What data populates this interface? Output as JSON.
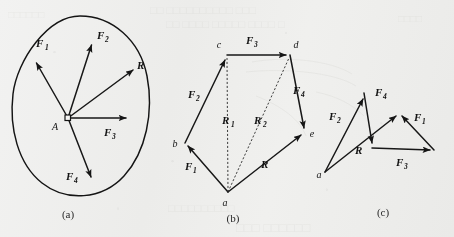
{
  "figure": {
    "background_color": "#f7f7f6",
    "ink_color": "#151515",
    "panel_count": 3
  },
  "panels": [
    {
      "id": "a",
      "caption": "(a)",
      "description": "Concurrent forces acting at point A inside a closed body outline",
      "origin_label": "A",
      "vectors": [
        {
          "name": "F1",
          "label": "F",
          "subscript": "1",
          "from": [
            68,
            118
          ],
          "to": [
            34,
            59
          ],
          "label_pos": [
            36,
            47
          ]
        },
        {
          "name": "F2",
          "label": "F",
          "subscript": "2",
          "from": [
            68,
            118
          ],
          "to": [
            93,
            41
          ],
          "label_pos": [
            98,
            39
          ]
        },
        {
          "name": "R",
          "label": "R",
          "subscript": "",
          "from": [
            68,
            118
          ],
          "to": [
            136,
            67
          ],
          "label_pos": [
            139,
            67
          ]
        },
        {
          "name": "F3",
          "label": "F",
          "subscript": "3",
          "from": [
            68,
            118
          ],
          "to": [
            130,
            118
          ],
          "label_pos": [
            108,
            134
          ]
        },
        {
          "name": "F4",
          "label": "F",
          "subscript": "4",
          "from": [
            68,
            118
          ],
          "to": [
            93,
            182
          ],
          "label_pos": [
            72,
            180
          ]
        }
      ]
    },
    {
      "id": "b",
      "caption": "(b)",
      "description": "Force polygon a-b-c-d-e with partial resultants R1 and R2 and closing resultant R",
      "points": [
        {
          "name": "a",
          "x": 228,
          "y": 192,
          "label_pos": [
            225,
            205
          ]
        },
        {
          "name": "b",
          "x": 185,
          "y": 143,
          "label_pos": [
            174,
            144
          ]
        },
        {
          "name": "c",
          "x": 227,
          "y": 55,
          "label_pos": [
            219,
            48
          ]
        },
        {
          "name": "d",
          "x": 290,
          "y": 55,
          "label_pos": [
            294,
            48
          ]
        },
        {
          "name": "e",
          "x": 305,
          "y": 132,
          "label_pos": [
            310,
            135
          ]
        }
      ],
      "vectors": [
        {
          "name": "F1",
          "label": "F",
          "subscript": "1",
          "from": [
            228,
            192
          ],
          "to": [
            185,
            143
          ],
          "label_pos": [
            189,
            165
          ]
        },
        {
          "name": "F2",
          "label": "F",
          "subscript": "2",
          "from": [
            185,
            143
          ],
          "to": [
            227,
            55
          ],
          "label_pos": [
            192,
            96
          ]
        },
        {
          "name": "F3",
          "label": "F",
          "subscript": "3",
          "from": [
            227,
            55
          ],
          "to": [
            290,
            55
          ],
          "label_pos": [
            248,
            44
          ]
        },
        {
          "name": "F4",
          "label": "F",
          "subscript": "4",
          "from": [
            290,
            55
          ],
          "to": [
            305,
            132
          ],
          "label_pos": [
            295,
            93
          ]
        },
        {
          "name": "R",
          "label": "R",
          "subscript": "",
          "from": [
            228,
            192
          ],
          "to": [
            305,
            132
          ],
          "label_pos": [
            264,
            167
          ]
        }
      ],
      "partial_resultants": [
        {
          "name": "R1",
          "label": "R",
          "subscript": "1",
          "from": [
            228,
            192
          ],
          "to": [
            227,
            55
          ],
          "label_pos": [
            227,
            122
          ],
          "style": "dashed"
        },
        {
          "name": "R2",
          "label": "R",
          "subscript": "2",
          "from": [
            228,
            192
          ],
          "to": [
            290,
            55
          ],
          "label_pos": [
            258,
            122
          ],
          "style": "dashed"
        }
      ]
    },
    {
      "id": "c",
      "caption": "(c)",
      "description": "Same forces added in a different order giving the same resultant R",
      "points": [
        {
          "name": "a",
          "x": 325,
          "y": 172,
          "label_pos": [
            318,
            176
          ]
        }
      ],
      "vectors": [
        {
          "name": "F2",
          "label": "F",
          "subscript": "2",
          "from": [
            325,
            172
          ],
          "to": [
            365,
            95
          ],
          "label_pos": [
            332,
            118
          ]
        },
        {
          "name": "F4",
          "label": "F",
          "subscript": "4",
          "from": [
            365,
            95
          ],
          "to": [
            372,
            147
          ],
          "label_pos": [
            374,
            95
          ]
        },
        {
          "name": "F3",
          "label": "F",
          "subscript": "3",
          "from": [
            372,
            147
          ],
          "to": [
            434,
            150
          ],
          "label_pos": [
            399,
            163
          ]
        },
        {
          "name": "F1",
          "label": "F",
          "subscript": "1",
          "from": [
            434,
            150
          ],
          "to": [
            399,
            113
          ],
          "label_pos": [
            416,
            120
          ]
        },
        {
          "name": "R",
          "label": "R",
          "subscript": "",
          "from": [
            325,
            172
          ],
          "to": [
            399,
            113
          ],
          "label_pos": [
            356,
            152
          ]
        }
      ]
    }
  ],
  "captions": {
    "a": "(a)",
    "b": "(b)",
    "c": "(c)"
  }
}
